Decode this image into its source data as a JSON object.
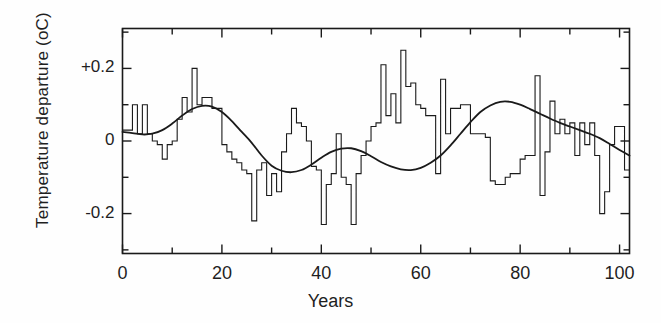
{
  "chart_data": {
    "type": "line",
    "title": "",
    "xlabel": "Years",
    "ylabel": "Temperature departure (oC)",
    "xlim": [
      0,
      102
    ],
    "ylim": [
      -0.31,
      0.31
    ],
    "grid": false,
    "legend": null,
    "xticks": [
      0,
      20,
      40,
      60,
      80,
      100
    ],
    "xtick_labels": [
      "0",
      "20",
      "40",
      "60",
      "80",
      "100"
    ],
    "xminor_step": 10,
    "yticks": [
      -0.2,
      0,
      0.2
    ],
    "ytick_labels": [
      "-0.2",
      "0",
      "+0.2"
    ],
    "yminor_step": 0.1,
    "series": [
      {
        "name": "annual departure",
        "type": "step",
        "x_start": 0,
        "x_step": 1,
        "values": [
          0.03,
          0.03,
          0.1,
          0.02,
          0.1,
          0.02,
          0.0,
          -0.01,
          -0.05,
          -0.01,
          0.0,
          0.06,
          0.12,
          0.08,
          0.2,
          0.1,
          0.12,
          0.12,
          0.09,
          0.09,
          -0.01,
          -0.03,
          -0.05,
          -0.06,
          -0.08,
          -0.09,
          -0.22,
          -0.08,
          -0.06,
          -0.15,
          -0.09,
          -0.14,
          -0.03,
          0.02,
          0.09,
          0.05,
          0.04,
          0.0,
          -0.07,
          -0.08,
          -0.23,
          -0.12,
          -0.09,
          0.02,
          -0.1,
          -0.12,
          -0.23,
          -0.09,
          -0.04,
          0.0,
          0.04,
          0.05,
          0.21,
          0.07,
          0.13,
          0.05,
          0.25,
          0.15,
          0.16,
          0.1,
          0.09,
          0.07,
          0.07,
          -0.09,
          0.17,
          0.02,
          0.09,
          0.09,
          0.1,
          0.1,
          0.02,
          0.02,
          0.02,
          0.01,
          -0.11,
          -0.12,
          -0.12,
          -0.1,
          -0.09,
          -0.09,
          -0.05,
          -0.04,
          -0.04,
          0.18,
          -0.15,
          -0.03,
          0.11,
          0.02,
          0.06,
          0.02,
          0.05,
          -0.04,
          0.05,
          -0.01,
          0.05,
          -0.04,
          -0.2,
          -0.14,
          -0.01,
          0.04,
          0.04,
          -0.08
        ]
      },
      {
        "name": "smoothed trend",
        "type": "line",
        "x": [
          0,
          2,
          4,
          6,
          8,
          10,
          12,
          14,
          16,
          18,
          20,
          22,
          24,
          26,
          28,
          30,
          32,
          34,
          36,
          38,
          40,
          42,
          44,
          46,
          48,
          50,
          52,
          54,
          56,
          58,
          60,
          62,
          64,
          66,
          68,
          70,
          72,
          74,
          76,
          78,
          80,
          82,
          84,
          86,
          88,
          90,
          92,
          94,
          96,
          98,
          100,
          102
        ],
        "values": [
          0.025,
          0.022,
          0.018,
          0.02,
          0.03,
          0.048,
          0.07,
          0.088,
          0.097,
          0.095,
          0.08,
          0.055,
          0.025,
          -0.005,
          -0.04,
          -0.068,
          -0.082,
          -0.086,
          -0.08,
          -0.065,
          -0.046,
          -0.03,
          -0.021,
          -0.02,
          -0.028,
          -0.042,
          -0.058,
          -0.07,
          -0.078,
          -0.08,
          -0.074,
          -0.06,
          -0.04,
          -0.012,
          0.02,
          0.052,
          0.08,
          0.098,
          0.108,
          0.108,
          0.1,
          0.088,
          0.075,
          0.062,
          0.05,
          0.04,
          0.03,
          0.02,
          0.008,
          -0.008,
          -0.025,
          -0.04
        ]
      }
    ]
  },
  "axes": {
    "frame_color": "#1a1a1a",
    "data_color": "#1a1a1a",
    "background": "#ffffff"
  }
}
